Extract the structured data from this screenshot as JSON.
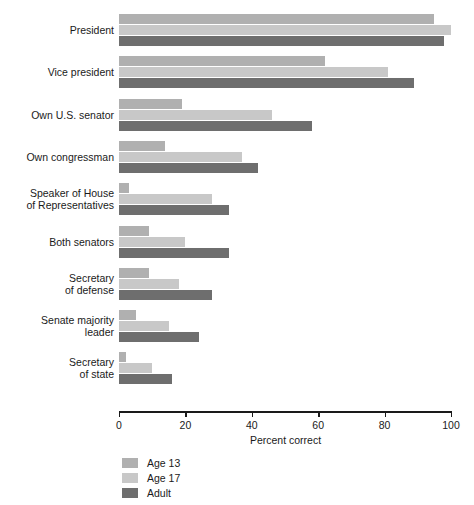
{
  "chart_data": {
    "type": "bar",
    "orientation": "horizontal",
    "title": "",
    "xlabel": "Percent correct",
    "ylabel": "Political leader",
    "xlim": [
      0,
      100
    ],
    "xticks": [
      0,
      20,
      40,
      60,
      80,
      100
    ],
    "grid": false,
    "legend_position": "below-left",
    "categories": [
      "President",
      "Vice president",
      "Own U.S. senator",
      "Own congressman",
      "Speaker of House\nof Representatives",
      "Both senators",
      "Secretary\nof defense",
      "Senate majority\nleader",
      "Secretary\nof state"
    ],
    "series": [
      {
        "name": "Age 13",
        "color": "#b0b0b0",
        "values": [
          95,
          62,
          19,
          14,
          3,
          9,
          9,
          5,
          2
        ]
      },
      {
        "name": "Age 17",
        "color": "#c8c8c8",
        "values": [
          100,
          81,
          46,
          37,
          28,
          20,
          18,
          15,
          10
        ]
      },
      {
        "name": "Adult",
        "color": "#6e6e6e",
        "values": [
          98,
          89,
          58,
          42,
          33,
          33,
          28,
          24,
          16
        ]
      }
    ]
  },
  "axis": {
    "tick_labels": [
      "0",
      "20",
      "40",
      "60",
      "80",
      "100"
    ]
  },
  "legend": {
    "entries": [
      {
        "label": "Age 13"
      },
      {
        "label": "Age 17"
      },
      {
        "label": "Adult"
      }
    ]
  }
}
